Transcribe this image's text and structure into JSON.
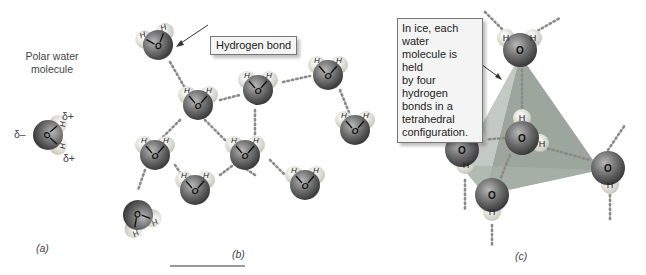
{
  "panel_a": {
    "title": "Polar water molecule",
    "title_line1": "Polar water",
    "title_line2": "molecule",
    "delta_minus": "δ–",
    "delta_plus_top": "δ+",
    "delta_plus_bottom": "δ+",
    "caption": "(a)"
  },
  "panel_b": {
    "callout": "Hydrogen bond",
    "caption": "(b)"
  },
  "panel_c": {
    "callout_lines": [
      "In ice, each water",
      "molecule is held",
      "by four hydrogen",
      "bonds in a",
      "tetrahedral",
      "configuration."
    ],
    "caption": "(c)"
  },
  "atoms": {
    "oxygen": "O",
    "hydrogen": "H"
  },
  "colors": {
    "oxygen": "#6e6e6e",
    "hydrogen": "#e6e6de",
    "bond_dots": "#8a8a8a",
    "tetra_face": "#9aa39a"
  }
}
